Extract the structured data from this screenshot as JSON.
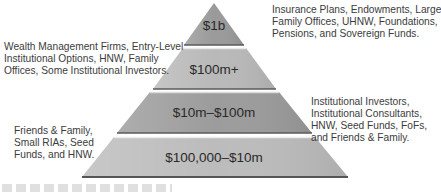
{
  "pyramid": {
    "tiers": [
      {
        "label": "$1b",
        "fill": "#9a9a9a"
      },
      {
        "label": "$100m+",
        "fill": "#b9b9b9"
      },
      {
        "label": "$10m–$100m",
        "fill": "#9c9c9c"
      },
      {
        "label": "$100,000–$10m",
        "fill": "#bcbcbc"
      }
    ]
  },
  "notes": {
    "tier_1b": [
      "Insurance Plans, Endowments, Large",
      "Family Offices, UHNW, Foundations,",
      "Pensions, and Sovereign Funds."
    ],
    "tier_100m": [
      "Wealth Management Firms, Entry-Level",
      "Institutional Options, HNW, Family",
      "Offices, Some Institutional Investors."
    ],
    "tier_10m": [
      "Institutional Investors,",
      "Institutional Consultants,",
      "HNW, Seed Funds, FoFs,",
      "and Friends & Family."
    ],
    "tier_100k": [
      "Friends & Family,",
      "Small RIAs, Seed",
      "Funds, and HNW."
    ]
  }
}
